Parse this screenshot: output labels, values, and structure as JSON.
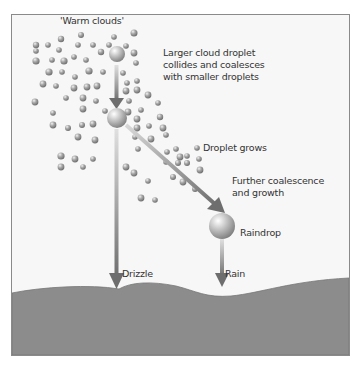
{
  "diagram": {
    "title": "'Warm clouds'",
    "labels": {
      "large_droplet": "Larger cloud droplet\ncollides and coalesces\nwith smaller droplets",
      "droplet_grows": "Droplet grows",
      "further_growth": "Further coalescence\nand growth",
      "raindrop": "Raindrop",
      "drizzle": "Drizzle",
      "rain": "Rain"
    },
    "colors": {
      "background": "#f7f7f7",
      "ground": "#8c8c8c",
      "droplet": "#9a9a9a",
      "arrow": "#7a7a7a",
      "frame": "#8a8a8a"
    }
  }
}
